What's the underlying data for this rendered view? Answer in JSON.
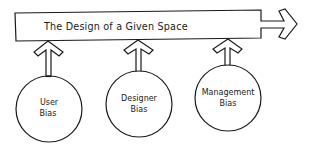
{
  "diagram": {
    "title": "The Design of a Given Space",
    "inputs": [
      {
        "line1": "User",
        "line2": "Bias"
      },
      {
        "line1": "Designer",
        "line2": "Bias"
      },
      {
        "line1": "Management",
        "line2": "Bias"
      }
    ],
    "colors": {
      "stroke": "#1a1a1a",
      "background": "#ffffff"
    }
  }
}
